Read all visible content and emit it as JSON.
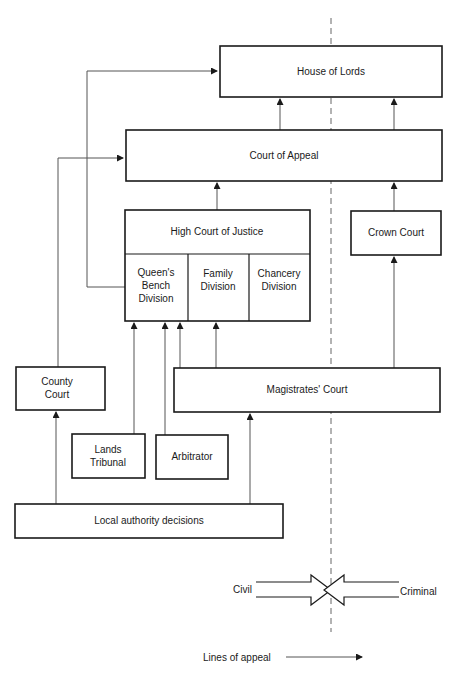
{
  "diagram": {
    "nodes": {
      "house_of_lords": "House of Lords",
      "court_of_appeal": "Court of Appeal",
      "high_court": "High Court of Justice",
      "queens_bench": [
        "Queen's",
        "Bench",
        "Division"
      ],
      "family": [
        "Family",
        "Division"
      ],
      "chancery": [
        "Chancery",
        "Division"
      ],
      "crown_court": "Crown Court",
      "county_court": [
        "County",
        "Court"
      ],
      "magistrates": "Magistrates' Court",
      "lands_tribunal": [
        "Lands",
        "Tribunal"
      ],
      "arbitrator": "Arbitrator",
      "local_authority": "Local authority decisions"
    },
    "edges": [
      {
        "from": "Court of Appeal",
        "to": "House of Lords",
        "side": "civil"
      },
      {
        "from": "Court of Appeal",
        "to": "House of Lords",
        "side": "criminal"
      },
      {
        "from": "Queen's Bench Division",
        "to": "House of Lords"
      },
      {
        "from": "High Court of Justice",
        "to": "Court of Appeal"
      },
      {
        "from": "County Court",
        "to": "Court of Appeal"
      },
      {
        "from": "Crown Court",
        "to": "Court of Appeal"
      },
      {
        "from": "Magistrates' Court",
        "to": "Crown Court"
      },
      {
        "from": "Magistrates' Court",
        "to": "Queen's Bench Division"
      },
      {
        "from": "Magistrates' Court",
        "to": "Family Division"
      },
      {
        "from": "Lands Tribunal",
        "to": "Queen's Bench Division"
      },
      {
        "from": "Arbitrator",
        "to": "Queen's Bench Division"
      },
      {
        "from": "Local authority decisions",
        "to": "County Court"
      },
      {
        "from": "Local authority decisions",
        "to": "Magistrates' Court"
      }
    ],
    "legend": {
      "civil_label": "Civil",
      "criminal_label": "Criminal",
      "lines_of_appeal_label": "Lines of appeal"
    }
  }
}
